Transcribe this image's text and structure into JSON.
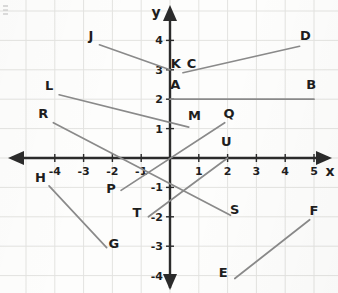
{
  "figure": {
    "kind": "coordinate-plane-line-segments",
    "background_color": "#fdfdfc",
    "grid_color": "#e3e3e0",
    "axis_color": "#2b2b2b",
    "segment_color": "#8a8a8a",
    "label_color": "#1e1e1e"
  },
  "axes": {
    "x_label": "x",
    "y_label": "y",
    "x_ticks": [
      "-4",
      "-3",
      "-2",
      "-1",
      "1",
      "2",
      "3",
      "4",
      "5"
    ],
    "y_ticks": [
      "4",
      "3",
      "2",
      "1",
      "-1",
      "-2",
      "-3",
      "-4"
    ],
    "x_range": [
      -5,
      5.6
    ],
    "y_range": [
      -4.6,
      4.4
    ],
    "grid": true
  },
  "chart_data": {
    "type": "scatter",
    "title": "",
    "xlabel": "x",
    "ylabel": "y",
    "xlim": [
      -5,
      5.6
    ],
    "ylim": [
      -4.6,
      4.4
    ],
    "grid": true,
    "categories": [
      "J-K",
      "C-D",
      "A-B",
      "L-M",
      "R-S",
      "P-Q",
      "T-U",
      "H-G",
      "E-F"
    ],
    "segments": [
      {
        "name": "J-K",
        "from": {
          "point": "J",
          "x": -2.45,
          "y": 3.85
        },
        "to": {
          "point": "K",
          "x": 0.0,
          "y": 3.0
        }
      },
      {
        "name": "C-D",
        "from": {
          "point": "C",
          "x": 0.45,
          "y": 2.9
        },
        "to": {
          "point": "D",
          "x": 4.5,
          "y": 3.8
        }
      },
      {
        "name": "A-B",
        "from": {
          "point": "A",
          "x": 0.0,
          "y": 2.0
        },
        "to": {
          "point": "B",
          "x": 5.0,
          "y": 2.0
        }
      },
      {
        "name": "L-M",
        "from": {
          "point": "L",
          "x": -3.85,
          "y": 2.15
        },
        "to": {
          "point": "M",
          "x": 0.65,
          "y": 1.05
        }
      },
      {
        "name": "R-S",
        "from": {
          "point": "R",
          "x": -4.05,
          "y": 1.2
        },
        "to": {
          "point": "S",
          "x": 2.1,
          "y": -1.95
        }
      },
      {
        "name": "P-Q",
        "from": {
          "point": "P",
          "x": -1.7,
          "y": -1.1
        },
        "to": {
          "point": "Q",
          "x": 1.9,
          "y": 1.2
        }
      },
      {
        "name": "T-U",
        "from": {
          "point": "T",
          "x": -0.75,
          "y": -2.0
        },
        "to": {
          "point": "U",
          "x": 2.0,
          "y": 0.0
        }
      },
      {
        "name": "H-G",
        "from": {
          "point": "H",
          "x": -4.2,
          "y": -0.95
        },
        "to": {
          "point": "G",
          "x": -2.2,
          "y": -3.05
        }
      },
      {
        "name": "E-F",
        "from": {
          "point": "E",
          "x": 2.25,
          "y": -4.1
        },
        "to": {
          "point": "F",
          "x": 4.85,
          "y": -2.1
        }
      }
    ],
    "point_labels": [
      {
        "text": "J",
        "x": -2.75,
        "y": 4.0
      },
      {
        "text": "K",
        "x": 0.2,
        "y": 3.05
      },
      {
        "text": "C",
        "x": 0.75,
        "y": 3.05
      },
      {
        "text": "D",
        "x": 4.7,
        "y": 4.0
      },
      {
        "text": "A",
        "x": 0.18,
        "y": 2.35
      },
      {
        "text": "B",
        "x": 4.9,
        "y": 2.35
      },
      {
        "text": "L",
        "x": -4.2,
        "y": 2.3
      },
      {
        "text": "M",
        "x": 0.85,
        "y": 1.3
      },
      {
        "text": "R",
        "x": -4.4,
        "y": 1.35
      },
      {
        "text": "Q",
        "x": 2.05,
        "y": 1.35
      },
      {
        "text": "U",
        "x": 1.95,
        "y": 0.4
      },
      {
        "text": "P",
        "x": -2.05,
        "y": -1.2
      },
      {
        "text": "T",
        "x": -1.15,
        "y": -2.0
      },
      {
        "text": "S",
        "x": 2.25,
        "y": -1.9
      },
      {
        "text": "H",
        "x": -4.5,
        "y": -0.8
      },
      {
        "text": "G",
        "x": -1.95,
        "y": -3.05
      },
      {
        "text": "E",
        "x": 1.85,
        "y": -4.05
      },
      {
        "text": "F",
        "x": 5.0,
        "y": -1.95
      }
    ]
  }
}
